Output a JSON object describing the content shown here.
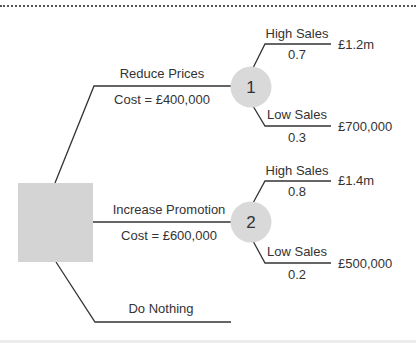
{
  "colors": {
    "line": "#333333",
    "decision_node_fill": "#d4d4d4",
    "chance_node_fill": "#d9d9d9",
    "text": "#333333"
  },
  "decision_node": {
    "shape": "square",
    "label": ""
  },
  "options": [
    {
      "label": "Reduce Prices",
      "cost": "Cost = £400,000",
      "chance_node": "1",
      "outcomes": [
        {
          "label": "High Sales",
          "probability": "0.7",
          "value": "£1.2m"
        },
        {
          "label": "Low Sales",
          "probability": "0.3",
          "value": "£700,000"
        }
      ]
    },
    {
      "label": "Increase Promotion",
      "cost": "Cost = £600,000",
      "chance_node": "2",
      "outcomes": [
        {
          "label": "High Sales",
          "probability": "0.8",
          "value": "£1.4m"
        },
        {
          "label": "Low Sales",
          "probability": "0.2",
          "value": "£500,000"
        }
      ]
    },
    {
      "label": "Do Nothing"
    }
  ]
}
